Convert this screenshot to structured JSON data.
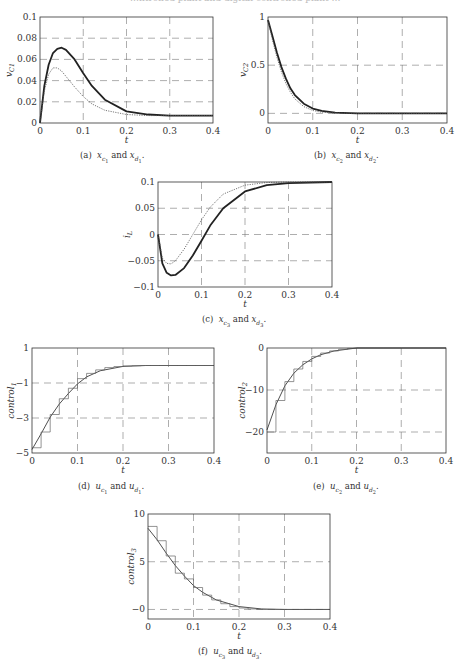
{
  "top_cropped_text": "…ntrolled plant and digital controlled plant …",
  "chart_data": [
    {
      "id": "a",
      "type": "line",
      "caption": "(a) x_c1 and x_d1.",
      "caption_parts": [
        "(a)",
        "x",
        "c1",
        "and",
        "x",
        "d1",
        "."
      ],
      "xlabel": "t",
      "ylabel": "v_C1",
      "xlim": [
        0,
        0.4
      ],
      "ylim": [
        0,
        0.1
      ],
      "xticks": [
        0,
        0.1,
        0.2,
        0.3,
        0.4
      ],
      "yticks": [
        0,
        0.02,
        0.04,
        0.06,
        0.08,
        0.1
      ],
      "ytick_labels": [
        "0",
        "0.02",
        "0.04",
        "0.06",
        "0.08",
        "0.1"
      ],
      "grid": "dashed",
      "box": {
        "x": 40,
        "y": 17,
        "w": 173,
        "h": 106
      },
      "series": [
        {
          "name": "continuous (solid, thick)",
          "x": [
            0,
            0.01,
            0.02,
            0.03,
            0.04,
            0.05,
            0.06,
            0.08,
            0.1,
            0.12,
            0.15,
            0.2,
            0.25,
            0.3,
            0.4
          ],
          "y": [
            0,
            0.035,
            0.055,
            0.066,
            0.07,
            0.071,
            0.069,
            0.06,
            0.047,
            0.035,
            0.022,
            0.011,
            0.008,
            0.007,
            0.007
          ]
        },
        {
          "name": "digital (dotted)",
          "x": [
            0,
            0.01,
            0.02,
            0.03,
            0.04,
            0.05,
            0.06,
            0.08,
            0.1,
            0.12,
            0.15,
            0.2,
            0.25,
            0.3,
            0.4
          ],
          "y": [
            0,
            0.03,
            0.046,
            0.052,
            0.052,
            0.049,
            0.044,
            0.034,
            0.025,
            0.018,
            0.012,
            0.008,
            0.007,
            0.007,
            0.007
          ]
        }
      ]
    },
    {
      "id": "b",
      "type": "line",
      "caption": "(b) x_c2 and x_d2.",
      "caption_parts": [
        "(b)",
        "x",
        "c2",
        "and",
        "x",
        "d2",
        "."
      ],
      "xlabel": "t",
      "ylabel": "v_C2",
      "xlim": [
        0,
        0.4
      ],
      "ylim": [
        -0.1,
        1
      ],
      "xticks": [
        0,
        0.1,
        0.2,
        0.3,
        0.4
      ],
      "yticks": [
        0,
        0.5,
        1
      ],
      "ytick_labels": [
        "0",
        "0.5",
        "1"
      ],
      "grid": "dashed",
      "box": {
        "x": 268,
        "y": 17,
        "w": 179,
        "h": 106
      },
      "series": [
        {
          "name": "continuous (solid, thick)",
          "x": [
            0,
            0.01,
            0.02,
            0.03,
            0.04,
            0.05,
            0.06,
            0.08,
            0.1,
            0.12,
            0.15,
            0.2,
            0.3,
            0.4
          ],
          "y": [
            0.97,
            0.8,
            0.63,
            0.48,
            0.36,
            0.26,
            0.19,
            0.1,
            0.05,
            0.025,
            0.008,
            0,
            0,
            0
          ]
        },
        {
          "name": "digital (dotted)",
          "x": [
            0,
            0.01,
            0.02,
            0.03,
            0.04,
            0.05,
            0.06,
            0.08,
            0.1,
            0.12,
            0.15,
            0.2,
            0.3,
            0.4
          ],
          "y": [
            0.97,
            0.76,
            0.58,
            0.43,
            0.31,
            0.22,
            0.15,
            0.07,
            0.03,
            0.012,
            0.003,
            0,
            0,
            0
          ]
        }
      ]
    },
    {
      "id": "c",
      "type": "line",
      "caption": "(c) x_c3 and x_d3.",
      "caption_parts": [
        "(c)",
        "x",
        "c3",
        "and",
        "x",
        "d3",
        "."
      ],
      "xlabel": "t",
      "ylabel": "i_L",
      "xlim": [
        0,
        0.4
      ],
      "ylim": [
        -0.1,
        0.1
      ],
      "xticks": [
        0,
        0.1,
        0.2,
        0.3,
        0.4
      ],
      "yticks": [
        -0.1,
        -0.05,
        0,
        0.05,
        0.1
      ],
      "ytick_labels": [
        "−0.1",
        "−0.05",
        "0",
        "0.05",
        "0.1"
      ],
      "grid": "dashed",
      "box": {
        "x": 158,
        "y": 182,
        "w": 174,
        "h": 105
      },
      "series": [
        {
          "name": "continuous (solid, thick)",
          "x": [
            0,
            0.01,
            0.02,
            0.03,
            0.04,
            0.06,
            0.08,
            0.1,
            0.12,
            0.15,
            0.2,
            0.25,
            0.3,
            0.4
          ],
          "y": [
            0,
            -0.055,
            -0.073,
            -0.078,
            -0.077,
            -0.064,
            -0.04,
            -0.012,
            0.017,
            0.05,
            0.082,
            0.094,
            0.098,
            0.1
          ]
        },
        {
          "name": "digital (dotted)",
          "x": [
            0,
            0.01,
            0.02,
            0.03,
            0.04,
            0.06,
            0.08,
            0.1,
            0.12,
            0.15,
            0.2,
            0.25,
            0.3,
            0.4
          ],
          "y": [
            0,
            -0.045,
            -0.055,
            -0.056,
            -0.05,
            -0.028,
            0.0,
            0.028,
            0.052,
            0.077,
            0.094,
            0.099,
            0.1,
            0.1
          ]
        }
      ]
    },
    {
      "id": "d",
      "type": "line",
      "caption": "(d) u_c1 and u_d1.",
      "caption_parts": [
        "(d)",
        "u",
        "c1",
        "and",
        "u",
        "d1",
        "."
      ],
      "xlabel": "t",
      "ylabel": "control_1",
      "xlim": [
        0,
        0.4
      ],
      "ylim": [
        -5,
        1
      ],
      "xticks": [
        0,
        0.1,
        0.2,
        0.3,
        0.4
      ],
      "yticks": [
        -5,
        -3,
        -1,
        1
      ],
      "ytick_labels": [
        "−5",
        "−3",
        "−1",
        "1"
      ],
      "grid": "dashed",
      "box": {
        "x": 32,
        "y": 348,
        "w": 182,
        "h": 105
      },
      "series": [
        {
          "name": "continuous control (solid)",
          "x": [
            0,
            0.02,
            0.04,
            0.06,
            0.08,
            0.1,
            0.12,
            0.15,
            0.2,
            0.25,
            0.3,
            0.4
          ],
          "y": [
            -4.8,
            -3.9,
            -2.95,
            -2.2,
            -1.6,
            -1.05,
            -0.65,
            -0.3,
            -0.05,
            0,
            0,
            0
          ]
        },
        {
          "name": "digital control (staircase)",
          "step": 0.02,
          "values": [
            -4.7,
            -3.8,
            -2.8,
            -1.9,
            -1.3,
            -0.75,
            -0.45,
            -0.25,
            -0.12,
            -0.06,
            -0.03,
            -0.01,
            0,
            0,
            0,
            0,
            0,
            0,
            0,
            0
          ]
        }
      ]
    },
    {
      "id": "e",
      "type": "line",
      "caption": "(e) u_c2 and u_d2.",
      "caption_parts": [
        "(e)",
        "u",
        "c2",
        "and",
        "u",
        "d2",
        "."
      ],
      "xlabel": "t",
      "ylabel": "control_2",
      "xlim": [
        0,
        0.4
      ],
      "ylim": [
        -25,
        0
      ],
      "xticks": [
        0,
        0.1,
        0.2,
        0.3,
        0.4
      ],
      "yticks": [
        -20,
        -10,
        0
      ],
      "ytick_labels": [
        "−20",
        "−10",
        "0"
      ],
      "grid": "dashed",
      "box": {
        "x": 267,
        "y": 348,
        "w": 179,
        "h": 105
      },
      "series": [
        {
          "name": "continuous control (solid)",
          "x": [
            0,
            0.02,
            0.04,
            0.06,
            0.08,
            0.1,
            0.12,
            0.15,
            0.2,
            0.3,
            0.4
          ],
          "y": [
            -19.5,
            -13.5,
            -9,
            -6,
            -4,
            -2.6,
            -1.6,
            -0.7,
            0,
            0,
            0
          ]
        },
        {
          "name": "digital control (staircase)",
          "step": 0.02,
          "values": [
            -20,
            -12.5,
            -8,
            -5,
            -3.2,
            -2,
            -1.2,
            -0.7,
            -0.3,
            -0.1,
            0,
            0,
            0,
            0,
            0,
            0,
            0,
            0,
            0,
            0
          ]
        }
      ]
    },
    {
      "id": "f",
      "type": "line",
      "caption": "(f) u_c3 and u_d3.",
      "caption_parts": [
        "(f)",
        "u",
        "c3",
        "and",
        "u",
        "d3",
        "."
      ],
      "xlabel": "t",
      "ylabel": "control_3",
      "xlim": [
        0,
        0.4
      ],
      "ylim": [
        -1,
        10
      ],
      "xticks": [
        0,
        0.1,
        0.2,
        0.3,
        0.4
      ],
      "yticks": [
        0,
        5,
        10
      ],
      "ytick_labels": [
        "−0",
        "5",
        "10"
      ],
      "grid": "dashed",
      "box": {
        "x": 148,
        "y": 514,
        "w": 182,
        "h": 105
      },
      "series": [
        {
          "name": "continuous control (solid)",
          "x": [
            0,
            0.02,
            0.04,
            0.06,
            0.08,
            0.1,
            0.12,
            0.15,
            0.2,
            0.25,
            0.3,
            0.4
          ],
          "y": [
            8.5,
            7.3,
            5.9,
            4.6,
            3.5,
            2.5,
            1.8,
            1.0,
            0.3,
            0.05,
            0,
            0
          ]
        },
        {
          "name": "digital control (staircase)",
          "step": 0.02,
          "values": [
            8.7,
            7.2,
            5.6,
            3.8,
            3.2,
            2.3,
            1.5,
            1.0,
            0.6,
            0.3,
            0.15,
            0.05,
            0,
            0,
            0,
            0,
            0,
            0,
            0,
            0
          ]
        }
      ]
    }
  ]
}
